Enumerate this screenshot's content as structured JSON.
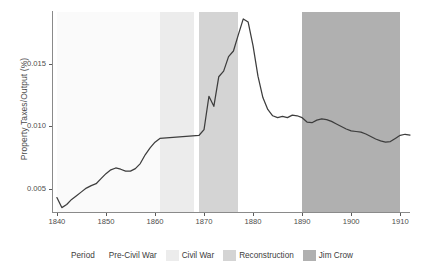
{
  "chart_data": {
    "type": "line",
    "title": "",
    "subtitle": "",
    "xlabel": "",
    "ylabel": "Property Taxes/Output (%)",
    "xlim": [
      1839,
      1912
    ],
    "ylim": [
      0.0032,
      0.0191
    ],
    "grid": false,
    "legend_position": "bottom",
    "x_ticks": [
      1840,
      1850,
      1860,
      1870,
      1880,
      1890,
      1900,
      1910
    ],
    "x_tick_labels": [
      "1840",
      "1850",
      "1860",
      "1870",
      "1880",
      "1890",
      "1900",
      "1910"
    ],
    "y_ticks": [
      0.005,
      0.01,
      0.015
    ],
    "y_tick_labels": [
      "0.005",
      "0.010",
      "0.015"
    ],
    "series": [
      {
        "name": "Property Taxes/Output",
        "color": "#3d3d3d",
        "x": [
          1840,
          1841,
          1842,
          1843,
          1844,
          1845,
          1846,
          1847,
          1848,
          1849,
          1850,
          1851,
          1852,
          1853,
          1854,
          1855,
          1856,
          1857,
          1858,
          1859,
          1860,
          1861,
          1869,
          1870,
          1871,
          1872,
          1873,
          1874,
          1875,
          1876,
          1877,
          1878,
          1879,
          1880,
          1881,
          1882,
          1883,
          1884,
          1885,
          1886,
          1887,
          1888,
          1889,
          1890,
          1891,
          1892,
          1893,
          1894,
          1895,
          1896,
          1897,
          1898,
          1899,
          1900,
          1901,
          1902,
          1903,
          1904,
          1905,
          1906,
          1907,
          1908,
          1909,
          1910,
          1911,
          1912
        ],
        "y": [
          0.00435,
          0.00355,
          0.0038,
          0.0042,
          0.0045,
          0.0048,
          0.0051,
          0.0053,
          0.00545,
          0.00585,
          0.00625,
          0.00655,
          0.0067,
          0.0066,
          0.00645,
          0.00645,
          0.00665,
          0.00705,
          0.00775,
          0.0083,
          0.00875,
          0.00905,
          0.0093,
          0.00975,
          0.0124,
          0.0116,
          0.01395,
          0.0144,
          0.01555,
          0.016,
          0.0173,
          0.01855,
          0.0183,
          0.0164,
          0.014,
          0.0123,
          0.01135,
          0.01085,
          0.0107,
          0.0108,
          0.0107,
          0.0109,
          0.01085,
          0.0107,
          0.01035,
          0.0103,
          0.0105,
          0.0106,
          0.01055,
          0.0104,
          0.0102,
          0.01,
          0.0098,
          0.00965,
          0.0096,
          0.00955,
          0.0094,
          0.0092,
          0.009,
          0.00885,
          0.00875,
          0.0088,
          0.00905,
          0.0093,
          0.00938,
          0.00932
        ]
      }
    ],
    "bands": [
      {
        "label": "Pre-Civil War",
        "start": 1840,
        "end": 1861,
        "color": "#fafafa"
      },
      {
        "label": "Civil War",
        "start": 1861,
        "end": 1868,
        "color": "#ececec"
      },
      {
        "label": "Reconstruction",
        "start": 1869,
        "end": 1877,
        "color": "#d4d4d4"
      },
      {
        "label": "Jim Crow",
        "start": 1890,
        "end": 1910,
        "color": "#b0b0b0"
      }
    ]
  },
  "legend": {
    "title": "Period",
    "items": [
      {
        "label": "Pre-Civil War",
        "color": "#fafafa"
      },
      {
        "label": "Civil War",
        "color": "#ececec"
      },
      {
        "label": "Reconstruction",
        "color": "#d4d4d4"
      },
      {
        "label": "Jim Crow",
        "color": "#b0b0b0"
      }
    ]
  },
  "axes": {
    "y_title": "Property Taxes/Output (%)",
    "y_tick_labels": [
      "0.015",
      "0.010",
      "0.005"
    ],
    "x_tick_labels": [
      "1840",
      "1850",
      "1860",
      "1870",
      "1880",
      "1890",
      "1900",
      "1910"
    ]
  }
}
